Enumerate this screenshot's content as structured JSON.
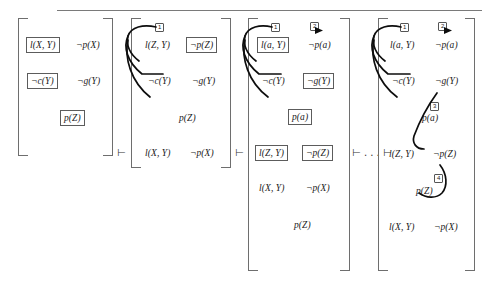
{
  "figure": {
    "top_rule": true,
    "separator_mid": "⊢ . . . ⊢",
    "turnstile": "⊢"
  },
  "panels": [
    {
      "id": "panel-1",
      "rows": [
        {
          "cells": [
            {
              "text": "l(X, Y)",
              "boxed": true
            },
            {
              "text": "¬p(X)",
              "boxed": false
            }
          ]
        },
        {
          "cells": [
            {
              "text": "¬c(Y)",
              "boxed": true
            },
            {
              "text": "¬g(Y)",
              "boxed": false
            }
          ]
        },
        {
          "cells": [
            {
              "text": "p(Z)",
              "boxed": true
            }
          ]
        }
      ],
      "tags": []
    },
    {
      "id": "panel-2",
      "rows": [
        {
          "cells": [
            {
              "text": "l(Z, Y)",
              "boxed": false
            },
            {
              "text": "¬p(Z)",
              "boxed": true
            }
          ]
        },
        {
          "cells": [
            {
              "text": "¬c(Y)",
              "boxed": false
            },
            {
              "text": "¬g(Y)",
              "boxed": false
            }
          ]
        },
        {
          "cells": [
            {
              "text": "p(Z)",
              "boxed": false
            }
          ]
        },
        {
          "cells": [
            {
              "text": "l(X, Y)",
              "boxed": false
            },
            {
              "text": "¬p(X)",
              "boxed": false
            }
          ]
        }
      ],
      "tags": [
        {
          "label": "1",
          "arrow": false
        }
      ]
    },
    {
      "id": "panel-3",
      "rows": [
        {
          "cells": [
            {
              "text": "l(a, Y)",
              "boxed": true
            },
            {
              "text": "¬p(a)",
              "boxed": false
            }
          ]
        },
        {
          "cells": [
            {
              "text": "¬c(Y)",
              "boxed": false
            },
            {
              "text": "¬g(Y)",
              "boxed": true
            }
          ]
        },
        {
          "cells": [
            {
              "text": "p(a)",
              "boxed": true
            }
          ]
        },
        {
          "cells": [
            {
              "text": "l(Z, Y)",
              "boxed": true
            },
            {
              "text": "¬p(Z)",
              "boxed": true
            }
          ]
        },
        {
          "cells": [
            {
              "text": "l(X, Y)",
              "boxed": false
            },
            {
              "text": "¬p(X)",
              "boxed": false
            }
          ]
        },
        {
          "cells": [
            {
              "text": "p(Z)",
              "boxed": false
            }
          ]
        }
      ],
      "tags": [
        {
          "label": "1",
          "arrow": false
        },
        {
          "label": "2",
          "arrow": true
        }
      ]
    },
    {
      "id": "panel-4",
      "rows": [
        {
          "cells": [
            {
              "text": "l(a, Y)",
              "boxed": false
            },
            {
              "text": "¬p(a)",
              "boxed": false
            }
          ]
        },
        {
          "cells": [
            {
              "text": "¬c(Y)",
              "boxed": false
            },
            {
              "text": "¬g(Y)",
              "boxed": false
            }
          ]
        },
        {
          "cells": [
            {
              "text": "p(a)",
              "boxed": false
            }
          ]
        },
        {
          "cells": [
            {
              "text": "l(Z, Y)",
              "boxed": false
            },
            {
              "text": "¬p(Z)",
              "boxed": false
            }
          ]
        },
        {
          "cells": [
            {
              "text": "p(Z)",
              "boxed": false
            }
          ]
        },
        {
          "cells": [
            {
              "text": "l(X, Y)",
              "boxed": false
            },
            {
              "text": "¬p(X)",
              "boxed": false
            }
          ]
        }
      ],
      "tags": [
        {
          "label": "1",
          "arrow": false
        },
        {
          "label": "2",
          "arrow": true
        },
        {
          "label": "3",
          "arrow": false
        },
        {
          "label": "4",
          "arrow": false
        }
      ]
    }
  ],
  "colors": {
    "ink": "#1a1a1a",
    "bracket": "#6e6e6e",
    "box_border": "#5c5c5c",
    "arc": "#0d0d0d",
    "rule": "#7a7a7a",
    "background": "#ffffff"
  }
}
